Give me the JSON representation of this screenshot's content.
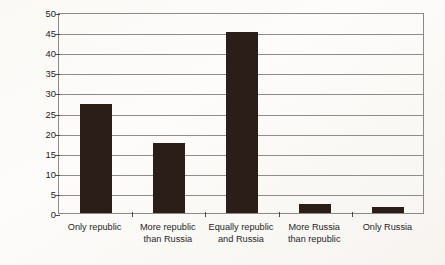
{
  "chart_data": {
    "type": "bar",
    "title": "",
    "subtitle": "",
    "xlabel": "",
    "ylabel": "Average percentage of  titular respondents",
    "categories": [
      "Only republic",
      "More republic\nthan Russia",
      "Equally republic\nand Russia",
      "More Russia\nthan republic",
      "Only Russia"
    ],
    "values": [
      27,
      17.5,
      45,
      2.3,
      1.6
    ],
    "ylim": [
      0,
      50
    ],
    "ytick_step": 5,
    "yticks": [
      50,
      45,
      40,
      35,
      30,
      25,
      20,
      15,
      10,
      5,
      0
    ],
    "ytick_labels": [
      "50",
      "45",
      "40",
      "35",
      "30",
      "25",
      "20",
      "15",
      "10",
      "5",
      "0"
    ],
    "grid": true,
    "grid_axis": "y",
    "legend": false,
    "legend_position": "none",
    "bar_color": "#2b1d18",
    "grid_color": "#8d8d89",
    "frame_color": "#8a8a86",
    "background_color": "#fdfcfa",
    "text_color": "#262626"
  }
}
